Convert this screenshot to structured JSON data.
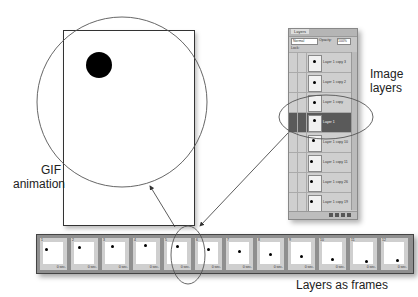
{
  "labels": {
    "gif_animation_line1": "GIF",
    "gif_animation_line2": "animation",
    "image_layers_line1": "Image",
    "image_layers_line2": "layers",
    "layers_as_frames": "Layers as frames"
  },
  "layers_panel": {
    "tab": "Layers",
    "blend_mode": "Normal",
    "opacity_label": "Opacity:",
    "opacity_value": "100%",
    "lock_label": "Lock:",
    "layers": [
      {
        "name": "Layer 1 copy 3",
        "selected": false,
        "dot_x": 4,
        "dot_y": 4
      },
      {
        "name": "Layer 1 copy 2",
        "selected": false,
        "dot_x": 4,
        "dot_y": 5
      },
      {
        "name": "Layer 1 copy",
        "selected": false,
        "dot_x": 4,
        "dot_y": 5
      },
      {
        "name": "Layer 1",
        "selected": true,
        "dot_x": 4,
        "dot_y": 3
      },
      {
        "name": "Layer 1 copy 10",
        "selected": false,
        "dot_x": 3,
        "dot_y": 3
      },
      {
        "name": "Layer 1 copy 11",
        "selected": false,
        "dot_x": 1,
        "dot_y": 4
      },
      {
        "name": "Layer 1 copy 26",
        "selected": false,
        "dot_x": 1,
        "dot_y": 4
      },
      {
        "name": "Layer 1 copy 19",
        "selected": false,
        "dot_x": 1,
        "dot_y": 4
      }
    ]
  },
  "frames": [
    {
      "num": "1",
      "time": "0 sec.",
      "dot_x": 2,
      "dot_y": 6
    },
    {
      "num": "2",
      "time": "0 sec.",
      "dot_x": 4,
      "dot_y": 4
    },
    {
      "num": "3",
      "time": "0 sec.",
      "dot_x": 6,
      "dot_y": 3
    },
    {
      "num": "4",
      "time": "0 sec.",
      "dot_x": 8,
      "dot_y": 2
    },
    {
      "num": "5",
      "time": "0 sec.",
      "dot_x": 9,
      "dot_y": 3
    },
    {
      "num": "6",
      "time": "0 sec.",
      "dot_x": 9,
      "dot_y": 6
    },
    {
      "num": "7",
      "time": "0 sec.",
      "dot_x": 9,
      "dot_y": 8
    },
    {
      "num": "8",
      "time": "0 sec.",
      "dot_x": 9,
      "dot_y": 11
    },
    {
      "num": "9",
      "time": "0 sec.",
      "dot_x": 9,
      "dot_y": 13
    },
    {
      "num": "10",
      "time": "0 sec.",
      "dot_x": 9,
      "dot_y": 16
    },
    {
      "num": "11",
      "time": "0 sec.",
      "dot_x": 12,
      "dot_y": 18
    },
    {
      "num": "12",
      "time": "0 sec.",
      "dot_x": 12,
      "dot_y": 17
    }
  ]
}
